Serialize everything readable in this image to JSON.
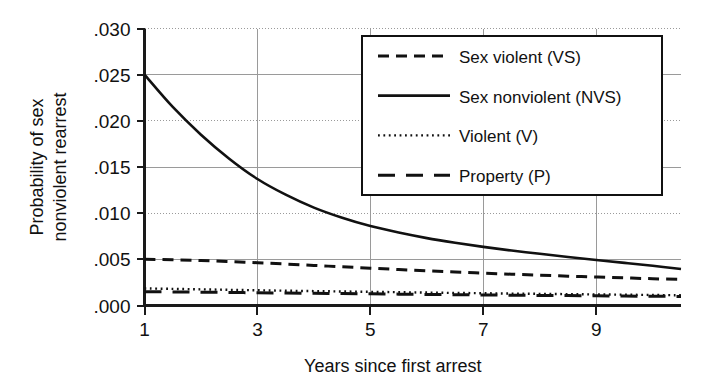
{
  "chart_data": {
    "type": "line",
    "title": "",
    "xlabel": "Years since first arrest",
    "ylabel": "Probability of sex nonviolent rearrest",
    "ylabel_line1": "Probability of sex",
    "ylabel_line2": "nonviolent rearrest",
    "xlim": [
      1,
      10.5
    ],
    "ylim": [
      0.0,
      0.03
    ],
    "xticks": [
      1,
      3,
      5,
      7,
      9
    ],
    "xticklabels": [
      "1",
      "3",
      "5",
      "7",
      "9"
    ],
    "yticks": [
      0.0,
      0.005,
      0.01,
      0.015,
      0.02,
      0.025,
      0.03
    ],
    "yticklabels": [
      ".000",
      ".005",
      ".010",
      ".015",
      ".020",
      ".025",
      ".030"
    ],
    "grid": true,
    "legend_position": "upper right",
    "x": [
      1,
      1.5,
      2,
      2.5,
      3,
      3.5,
      4,
      4.5,
      5,
      5.5,
      6,
      6.5,
      7,
      7.5,
      8,
      8.5,
      9,
      9.5,
      10,
      10.5
    ],
    "series": [
      {
        "name": "Sex violent (VS)",
        "key": "VS",
        "style": "dashed",
        "values": [
          0.005,
          0.00495,
          0.00487,
          0.00476,
          0.00463,
          0.00449,
          0.00434,
          0.00419,
          0.00404,
          0.0039,
          0.00376,
          0.00363,
          0.00351,
          0.00339,
          0.00328,
          0.00318,
          0.00308,
          0.00299,
          0.0029,
          0.00282
        ]
      },
      {
        "name": "Sex nonviolent (NVS)",
        "key": "NVS",
        "style": "solid",
        "values": [
          0.025,
          0.0215,
          0.0185,
          0.0159,
          0.0137,
          0.012,
          0.0106,
          0.0095,
          0.0086,
          0.0079,
          0.0073,
          0.0068,
          0.00635,
          0.00595,
          0.0056,
          0.00525,
          0.00493,
          0.00462,
          0.0043,
          0.00395
        ]
      },
      {
        "name": "Violent (V)",
        "key": "V",
        "style": "dotted",
        "values": [
          0.00185,
          0.0018,
          0.00175,
          0.0017,
          0.00165,
          0.0016,
          0.00156,
          0.00152,
          0.00148,
          0.00144,
          0.0014,
          0.00136,
          0.00133,
          0.00129,
          0.00126,
          0.00123,
          0.0012,
          0.00117,
          0.00114,
          0.00111
        ]
      },
      {
        "name": "Property (P)",
        "key": "P",
        "style": "longdash",
        "values": [
          0.0015,
          0.00147,
          0.00144,
          0.00141,
          0.00138,
          0.00135,
          0.00132,
          0.00129,
          0.00126,
          0.00123,
          0.0012,
          0.00117,
          0.00114,
          0.00112,
          0.00109,
          0.00107,
          0.00105,
          0.00102,
          0.001,
          0.00098
        ]
      }
    ],
    "legend": [
      {
        "label": "Sex violent (VS)",
        "style": "dashed"
      },
      {
        "label": "Sex nonviolent (NVS)",
        "style": "solid"
      },
      {
        "label": "Violent (V)",
        "style": "dotted"
      },
      {
        "label": "Property (P)",
        "style": "longdash"
      }
    ],
    "colors": {
      "line": "#111111",
      "grid": "#9a9a9a",
      "axis": "#1a1a1a",
      "background": "#ffffff"
    }
  }
}
